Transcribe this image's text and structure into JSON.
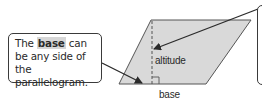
{
  "diagram": {
    "type": "geometry-parallelogram",
    "shape_fill": "#d9d9d9",
    "outline_color": "#3a3a3a",
    "callout": {
      "text_before": "The ",
      "highlight": "base",
      "text_after": " can be any side of the parallelogram."
    },
    "labels": {
      "altitude": "altitude",
      "base": "base"
    }
  }
}
